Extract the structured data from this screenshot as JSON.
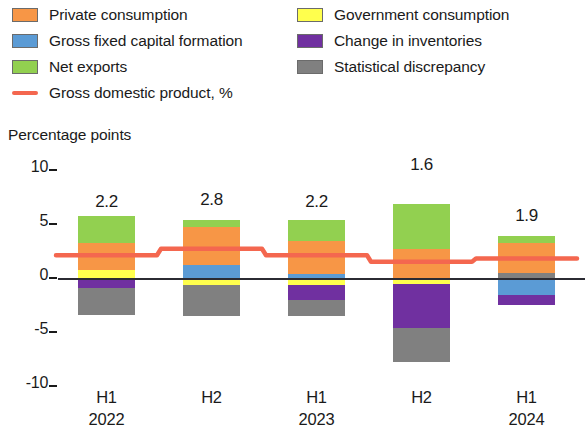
{
  "legend": {
    "items": [
      {
        "label": "Private consumption",
        "color": "#f79646",
        "type": "swatch",
        "icon": "legend-swatch-private-consumption"
      },
      {
        "label": "Gross fixed capital formation",
        "color": "#5b9bd5",
        "type": "swatch",
        "icon": "legend-swatch-gross-fixed-capital-formation"
      },
      {
        "label": "Net exports",
        "color": "#92d050",
        "type": "swatch",
        "icon": "legend-swatch-net-exports"
      },
      {
        "label": "Gross domestic product, %",
        "color": "#f4674f",
        "type": "line",
        "icon": "legend-line-gross-domestic-product"
      },
      {
        "label": "Government consumption",
        "color": "#ffff4d",
        "type": "swatch",
        "icon": "legend-swatch-government-consumption"
      },
      {
        "label": "Change in inventories",
        "color": "#7030a0",
        "type": "swatch",
        "icon": "legend-swatch-change-in-inventories"
      },
      {
        "label": "Statistical discrepancy",
        "color": "#808080",
        "type": "swatch",
        "icon": "legend-swatch-statistical-discrepancy"
      }
    ]
  },
  "axis": {
    "y_title": "Percentage points",
    "y_ticks": [
      "10",
      "5",
      "0",
      "-5",
      "-10"
    ],
    "x_labels": [
      {
        "period": "H1",
        "year": "2022"
      },
      {
        "period": "H2",
        "year": ""
      },
      {
        "period": "H1",
        "year": "2023"
      },
      {
        "period": "H2",
        "year": ""
      },
      {
        "period": "H1",
        "year": "2024"
      }
    ]
  },
  "chart_data": {
    "type": "bar",
    "title": "",
    "subtitle": "",
    "xlabel": "",
    "ylabel": "Percentage points",
    "ylim": [
      -10,
      10
    ],
    "grid": false,
    "stacked": true,
    "legend_position": "top",
    "categories": [
      "H1 2022",
      "H2 2022",
      "H1 2023",
      "H2 2023",
      "H1 2024"
    ],
    "series": [
      {
        "name": "Private consumption",
        "color": "#f79646",
        "values": [
          2.5,
          3.5,
          3.0,
          2.8,
          2.7
        ]
      },
      {
        "name": "Gross fixed capital formation",
        "color": "#5b9bd5",
        "values": [
          0.0,
          1.3,
          0.5,
          0.0,
          -1.5
        ]
      },
      {
        "name": "Net exports",
        "color": "#92d050",
        "values": [
          2.5,
          0.7,
          2.0,
          4.1,
          0.7
        ]
      },
      {
        "name": "Government consumption",
        "color": "#ffff4d",
        "values": [
          0.8,
          -0.6,
          -0.6,
          -0.5,
          0.0
        ]
      },
      {
        "name": "Change in inventories",
        "color": "#7030a0",
        "values": [
          -0.8,
          0.6,
          -1.3,
          -4.0,
          -0.9
        ]
      },
      {
        "name": "Statistical discrepancy",
        "color": "#808080",
        "values": [
          -2.5,
          -2.8,
          -1.5,
          -3.2,
          0.6
        ]
      }
    ],
    "line_series": {
      "name": "Gross domestic product, %",
      "color": "#f4674f",
      "values": [
        2.2,
        2.8,
        2.2,
        1.6,
        1.9
      ],
      "data_labels": [
        "2.2",
        "2.8",
        "2.2",
        "1.6",
        "1.9"
      ]
    }
  }
}
